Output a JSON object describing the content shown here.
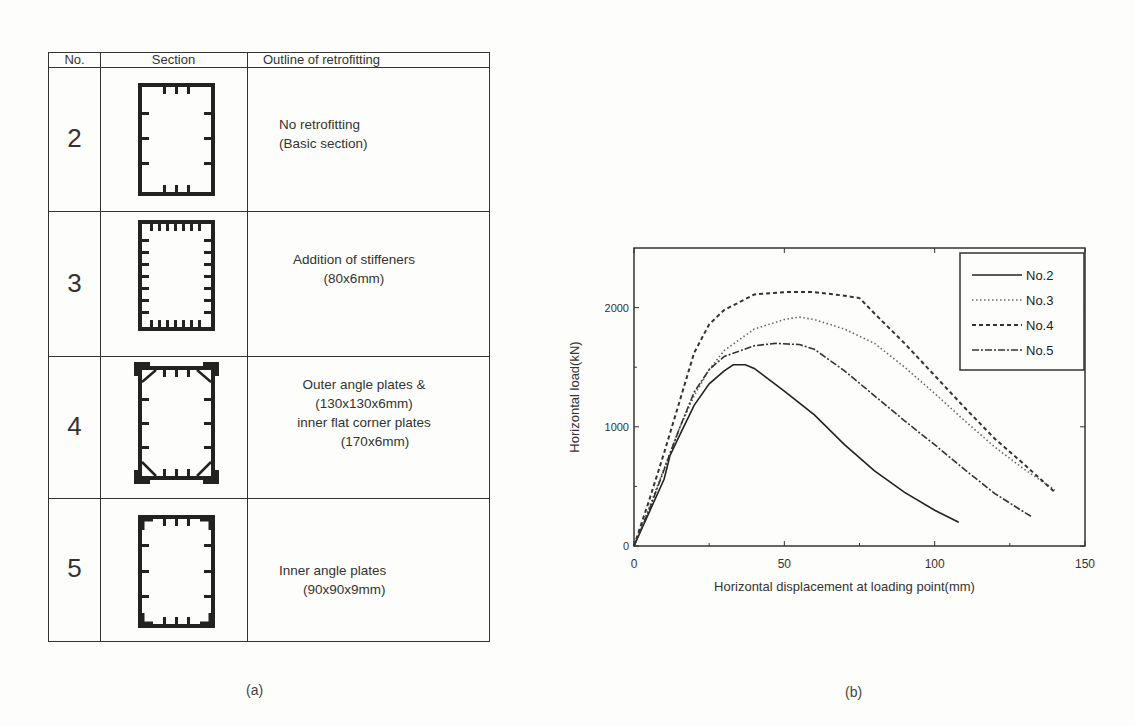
{
  "table": {
    "headers": [
      "No.",
      "Section",
      "Outline of retrofitting"
    ],
    "rows": [
      {
        "no": "2",
        "section_icon": "basic-box-section-icon",
        "lines": [
          "No retrofitting",
          "(Basic section)"
        ]
      },
      {
        "no": "3",
        "section_icon": "stiffened-box-section-icon",
        "lines": [
          "Addition of stiffeners",
          "(80x6mm)"
        ]
      },
      {
        "no": "4",
        "section_icon": "angle-plate-box-section-icon",
        "lines": [
          "Outer angle plates &",
          "(130x130x6mm)",
          "inner flat corner plates",
          "(170x6mm)"
        ]
      },
      {
        "no": "5",
        "section_icon": "inner-angle-box-section-icon",
        "lines": [
          "Inner angle plates",
          "(90x90x9mm)"
        ]
      }
    ]
  },
  "captions": {
    "a": "(a)",
    "b": "(b)"
  },
  "chart_data": {
    "type": "line",
    "title": "",
    "xlabel": "Horizontal displacement at loading point(mm)",
    "ylabel": "Horizontal load(kN)",
    "xlim": [
      0,
      150
    ],
    "ylim": [
      0,
      2500
    ],
    "xticks": [
      0,
      50,
      100,
      150
    ],
    "yticks": [
      0,
      1000,
      2000
    ],
    "grid": false,
    "legend_position": "upper right",
    "series": [
      {
        "name": "No.2",
        "style": "solid",
        "x": [
          0,
          5,
          10,
          12,
          15,
          20,
          25,
          30,
          33,
          37,
          40,
          50,
          60,
          70,
          80,
          90,
          100,
          108
        ],
        "y": [
          0,
          280,
          560,
          760,
          920,
          1180,
          1360,
          1470,
          1520,
          1520,
          1490,
          1300,
          1100,
          850,
          630,
          450,
          300,
          200
        ]
      },
      {
        "name": "No.3",
        "style": "dotted",
        "x": [
          0,
          5,
          10,
          15,
          20,
          25,
          30,
          40,
          50,
          55,
          60,
          70,
          80,
          90,
          100,
          110,
          120,
          130,
          140
        ],
        "y": [
          0,
          320,
          650,
          980,
          1260,
          1480,
          1640,
          1820,
          1900,
          1920,
          1900,
          1820,
          1700,
          1500,
          1280,
          1050,
          830,
          640,
          470
        ]
      },
      {
        "name": "No.4",
        "style": "dashed",
        "x": [
          0,
          5,
          10,
          15,
          20,
          25,
          30,
          40,
          50,
          60,
          70,
          75,
          80,
          90,
          100,
          110,
          120,
          130,
          140
        ],
        "y": [
          0,
          380,
          780,
          1200,
          1620,
          1860,
          1980,
          2110,
          2130,
          2130,
          2100,
          2080,
          1950,
          1700,
          1430,
          1160,
          900,
          680,
          450
        ]
      },
      {
        "name": "No.5",
        "style": "dash-dot",
        "x": [
          0,
          5,
          10,
          15,
          20,
          25,
          30,
          40,
          47,
          55,
          60,
          70,
          80,
          90,
          100,
          110,
          120,
          130,
          132
        ],
        "y": [
          0,
          300,
          640,
          980,
          1290,
          1480,
          1590,
          1680,
          1700,
          1690,
          1650,
          1470,
          1260,
          1050,
          850,
          640,
          440,
          280,
          250
        ]
      }
    ]
  }
}
